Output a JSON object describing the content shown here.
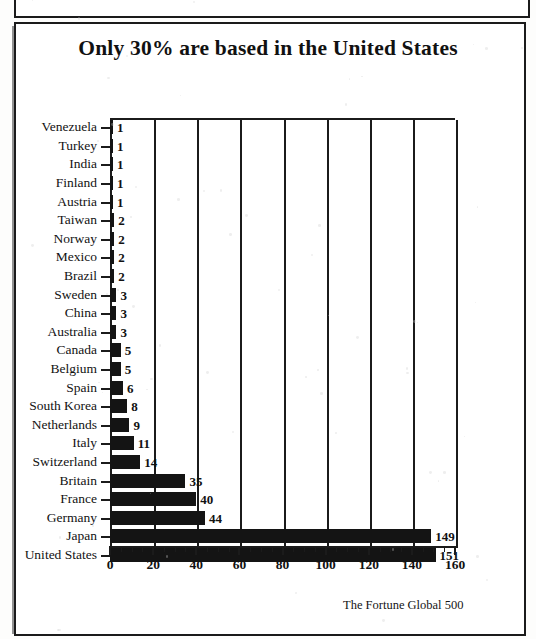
{
  "page": {
    "top_strip_text": "FORTUNE 500",
    "title": "Only 30% are based in the United States",
    "source_note": "The Fortune Global 500"
  },
  "chart_data": {
    "type": "bar",
    "orientation": "horizontal",
    "title": "Only 30% are based in the United States",
    "xlabel": "",
    "ylabel": "",
    "xlim": [
      0,
      160
    ],
    "xticks": [
      0,
      20,
      40,
      60,
      80,
      100,
      120,
      140,
      160
    ],
    "xtick_labels": [
      "0",
      "20",
      "40",
      "60",
      "80",
      "100",
      "120",
      "140",
      "160"
    ],
    "minor_tick_step": 5,
    "grid": "vertical",
    "legend": "none",
    "bar_color": "#141414",
    "categories": [
      "Venezuela",
      "Turkey",
      "India",
      "Finland",
      "Austria",
      "Taiwan",
      "Norway",
      "Mexico",
      "Brazil",
      "Sweden",
      "China",
      "Australia",
      "Canada",
      "Belgium",
      "Spain",
      "South Korea",
      "Netherlands",
      "Italy",
      "Switzerland",
      "Britain",
      "France",
      "Germany",
      "Japan",
      "United States"
    ],
    "values": [
      1,
      1,
      1,
      1,
      1,
      2,
      2,
      2,
      2,
      3,
      3,
      3,
      5,
      5,
      6,
      8,
      9,
      11,
      14,
      35,
      40,
      44,
      149,
      151
    ],
    "value_labels": [
      "1",
      "1",
      "1",
      "1",
      "1",
      "2",
      "2",
      "2",
      "2",
      "3",
      "3",
      "3",
      "5",
      "5",
      "6",
      "8",
      "9",
      "11",
      "14",
      "35",
      "40",
      "44",
      "149",
      "151"
    ],
    "source": "The Fortune Global 500"
  }
}
